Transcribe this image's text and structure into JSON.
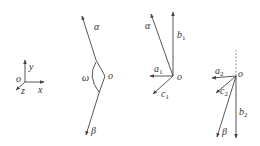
{
  "figure": {
    "panels": [
      {
        "id": "coordinate-frame",
        "labels": {
          "origin": "o",
          "x": "x",
          "y": "y",
          "z": "z"
        }
      },
      {
        "id": "angle-panel",
        "labels": {
          "vertex": "o",
          "alpha": "α",
          "beta": "β",
          "omega": "ω"
        }
      },
      {
        "id": "frame-1",
        "labels": {
          "origin": "o",
          "alpha": "α",
          "a": "a",
          "a_sub": "1",
          "b": "b",
          "b_sub": "1",
          "c": "c",
          "c_sub": "1"
        }
      },
      {
        "id": "frame-2",
        "labels": {
          "origin": "o",
          "beta": "β",
          "a": "a",
          "a_sub": "2",
          "b": "b",
          "b_sub": "2",
          "c": "c",
          "c_sub": "2"
        }
      }
    ],
    "colors": {
      "stroke": "#444444",
      "text": "#333333"
    }
  }
}
